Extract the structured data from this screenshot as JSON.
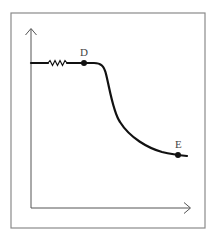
{
  "figure": {
    "type": "curve-diagram",
    "axes": {
      "x_label": "",
      "y_label": "",
      "x_arrow": true,
      "y_arrow": true
    },
    "points": [
      {
        "label": "D",
        "description": "end of flat plateau, start of drop"
      },
      {
        "label": "E",
        "description": "point on lower flattening tail"
      }
    ],
    "features": {
      "plateau_break": "zigzag (axis-break) mark on the initial horizontal segment",
      "curve_shape": "flat high plateau, then steep sigmoid drop, then gradually leveling off"
    },
    "colors": {
      "curve": "#111111",
      "axes": "#555555",
      "frame": "#8a8a8a",
      "labels": "#444444"
    }
  }
}
